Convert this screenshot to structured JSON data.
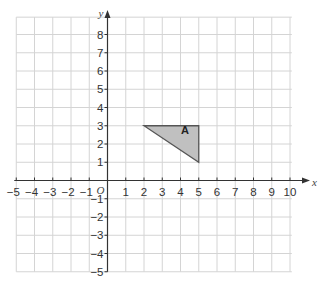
{
  "diagram": {
    "type": "coordinate-grid",
    "x_axis": {
      "label": "x",
      "min": -5,
      "max": 10,
      "ticks": [
        "-5",
        "-4",
        "-3",
        "-2",
        "-1",
        "1",
        "2",
        "3",
        "4",
        "5",
        "6",
        "7",
        "8",
        "9",
        "10"
      ]
    },
    "y_axis": {
      "label": "y",
      "min": -5,
      "max": 9,
      "ticks": [
        "8",
        "7",
        "6",
        "5",
        "4",
        "3",
        "2",
        "1",
        "-1",
        "-2",
        "-3",
        "-4",
        "-5"
      ]
    },
    "origin_label": "O",
    "shapes": [
      {
        "name": "A",
        "label": "A",
        "vertices": [
          [
            2,
            3
          ],
          [
            5,
            3
          ],
          [
            5,
            1
          ]
        ],
        "fill": "#c0c0c0",
        "stroke": "#555555"
      }
    ],
    "colors": {
      "grid": "#d4d4d4",
      "axis": "#333333",
      "background": "#ffffff"
    }
  }
}
